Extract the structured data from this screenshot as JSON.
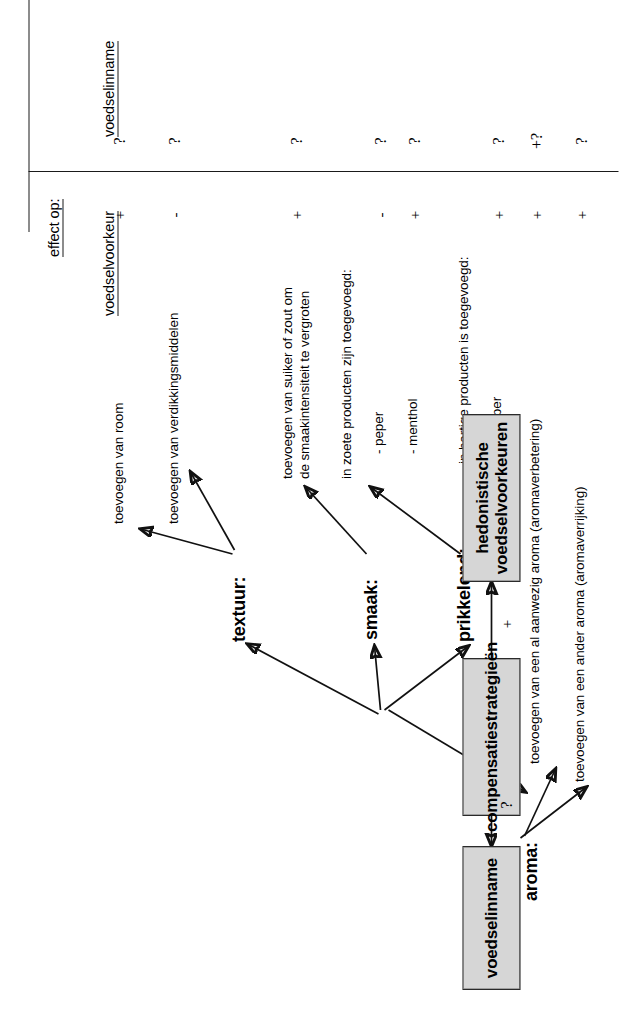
{
  "figure": {
    "title_hidden": "",
    "axis_header": "effect op:",
    "column_headers": [
      {
        "id": "voedselvoorkeur",
        "label": "voedselvoorkeur"
      },
      {
        "id": "voedselinname",
        "label": "voedselinname"
      }
    ]
  },
  "nodes": [
    {
      "id": "voedselinname",
      "label": "voedselinname"
    },
    {
      "id": "compensatiestrategieen",
      "label": "compensatiestrategieën"
    },
    {
      "id": "hedonistische",
      "label_line1": "hedonistische",
      "label_line2": "voedselvoorkeuren"
    }
  ],
  "bottom_links": [
    {
      "id": "comp-to-inname",
      "label": "?"
    },
    {
      "id": "comp-to-hedonistisch",
      "label": "+"
    }
  ],
  "categories": [
    {
      "id": "textuur",
      "label": "textuur:"
    },
    {
      "id": "smaak",
      "label": "smaak:"
    },
    {
      "id": "prikkelend",
      "label": "prikkelend:"
    },
    {
      "id": "aroma",
      "label": "aroma:"
    }
  ],
  "strategies": [
    {
      "id": "room",
      "category": "textuur",
      "text_lines": [
        "toevoegen van room"
      ],
      "effect_voedselvoorkeur": "+",
      "effect_voedselinname": "?"
    },
    {
      "id": "verdikkingsmiddelen",
      "category": "textuur",
      "text_lines": [
        "toevoegen van verdikkingsmiddelen"
      ],
      "effect_voedselvoorkeur": "-",
      "effect_voedselinname": "?"
    },
    {
      "id": "suiker-zout",
      "category": "smaak",
      "text_lines": [
        "toevoegen van suiker of zout om",
        "de smaakintensiteit te vergroten"
      ],
      "effect_voedselvoorkeur": "+",
      "effect_voedselinname": "?"
    },
    {
      "id": "zoete-producten",
      "category": "prikkelend",
      "text_lines": [
        "in zoete producten zijn toegevoegd:"
      ],
      "sub_items": [
        {
          "id": "peper-zoet",
          "label": "- peper",
          "effect_voedselvoorkeur": "-",
          "effect_voedselinname": "?"
        },
        {
          "id": "menthol",
          "label": "- menthol",
          "effect_voedselvoorkeur": "+",
          "effect_voedselinname": "?"
        }
      ]
    },
    {
      "id": "hartige-producten",
      "category": "prikkelend",
      "text_lines": [
        "in hartige producten is toegevoegd:"
      ],
      "sub_items": [
        {
          "id": "peper-hartig",
          "label": "- peper",
          "effect_voedselvoorkeur": "+",
          "effect_voedselinname": "?"
        }
      ]
    },
    {
      "id": "aromaverbetering",
      "category": "aroma",
      "text_lines": [
        "toevoegen van een al aanwezig aroma (aromaverbetering)"
      ],
      "effect_voedselvoorkeur": "+",
      "effect_voedselinname": "+?"
    },
    {
      "id": "aromaverrijking",
      "category": "aroma",
      "text_lines": [
        "toevoegen van een ander aroma (aromaverrijking)"
      ],
      "effect_voedselvoorkeur": "+",
      "effect_voedselinname": "?"
    }
  ],
  "effect_rows": [
    {
      "id": "row-room",
      "voorkeur": "+",
      "inname": "?"
    },
    {
      "id": "row-verdikking",
      "voorkeur": "-",
      "inname": "?"
    },
    {
      "id": "row-suiker-zout",
      "voorkeur": "+",
      "inname": "?"
    },
    {
      "id": "row-peper-zoet",
      "voorkeur": "-",
      "inname": "?"
    },
    {
      "id": "row-menthol",
      "voorkeur": "+",
      "inname": "?"
    },
    {
      "id": "row-peper-hartig",
      "voorkeur": "+",
      "inname": "?"
    },
    {
      "id": "row-aromaverbetering",
      "voorkeur": "+",
      "inname": "+?"
    },
    {
      "id": "row-aromaverrijking",
      "voorkeur": "+",
      "inname": "?"
    }
  ],
  "colors": {
    "node_fill": "#d6d6d6",
    "node_border": "#2a2a2a",
    "line": "#111111",
    "text": "#000000",
    "background": "#ffffff"
  }
}
